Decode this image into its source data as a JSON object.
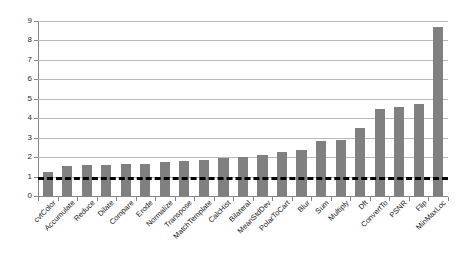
{
  "chart_data": {
    "type": "bar",
    "title": "",
    "subtitle": "",
    "xlabel": "",
    "ylabel": "",
    "ylim": [
      0,
      9
    ],
    "yticks": [
      0,
      1,
      2,
      3,
      4,
      5,
      6,
      7,
      8,
      9
    ],
    "ytick_labels": [
      "0",
      "1",
      "2",
      "3",
      "4",
      "5",
      "6",
      "7",
      "8",
      "9"
    ],
    "grid": true,
    "legend": false,
    "legend_position": "none",
    "bar_color": "#808080",
    "gridline_color": "#b9b9b9",
    "axis_color": "#868686",
    "threshold_line": {
      "value": 1,
      "style": "dashed",
      "color": "#000000",
      "width_px": 3
    },
    "categories": [
      "cvtColor",
      "Accumulate",
      "Reduce",
      "Dilate",
      "Compare",
      "Erode",
      "Normalize",
      "Transpose",
      "MatchTemplate",
      "CalcHist",
      "Bilateral",
      "MeanStdDev",
      "PolarToCart",
      "Blur",
      "Sum",
      "Multiply",
      "Dft",
      "ConvertTo",
      "PSNR",
      "Flip",
      "MinMaxLoc"
    ],
    "values": [
      1.25,
      1.55,
      1.58,
      1.58,
      1.66,
      1.66,
      1.73,
      1.8,
      1.86,
      1.97,
      2.0,
      2.13,
      2.25,
      2.35,
      2.85,
      2.9,
      3.5,
      4.45,
      4.57,
      4.73,
      8.7
    ]
  }
}
